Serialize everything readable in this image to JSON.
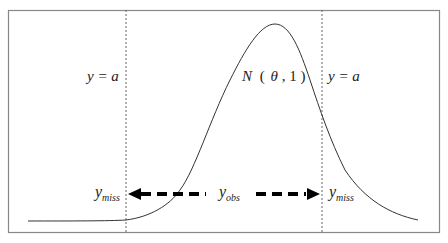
{
  "diagram": {
    "curve_label": {
      "N": "N",
      "open": "(",
      "theta": "θ",
      "comma": ",",
      "one": "1",
      "close": ")"
    },
    "threshold_left": "y = a",
    "threshold_right": "y = a",
    "left_missing": {
      "base": "y",
      "sub": "miss"
    },
    "observed": {
      "base": "y",
      "sub": "obs"
    },
    "right_missing": {
      "base": "y",
      "sub": "miss"
    },
    "colors": {
      "line": "#333333",
      "frame": "#777777",
      "dashed": "#666666"
    }
  }
}
